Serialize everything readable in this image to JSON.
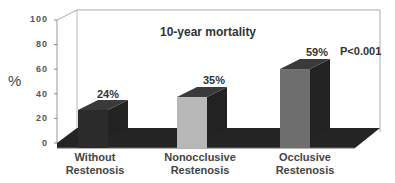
{
  "chart_data": {
    "type": "bar",
    "style": "3d-column",
    "title": "10-year mortality",
    "xlabel": "",
    "ylabel": "%",
    "ylim": [
      0,
      100
    ],
    "yticks": [
      "0",
      "20",
      "40",
      "60",
      "80",
      "100"
    ],
    "categories": [
      "Without Restenosis",
      "Nonocclusive Restenosis",
      "Occlusive Restenosis"
    ],
    "category_lines": [
      [
        "Without",
        "Restenosis"
      ],
      [
        "Nonocclusive",
        "Restenosis"
      ],
      [
        "Occlusive",
        "Restenosis"
      ]
    ],
    "values": [
      24,
      35,
      59
    ],
    "value_labels": [
      "24%",
      "35%",
      "59%"
    ],
    "annotations": [
      "P<0.001"
    ],
    "grid": false,
    "legend": null,
    "colors": {
      "bar_without_front": "#2b2b2b",
      "bar_nonocclusive_front": "#b8b8b8",
      "bar_occlusive_front": "#6e6e6e",
      "bar_side": "#222222",
      "bar_top": "#3a3a3a",
      "floor": "#242424",
      "wall_line": "#aaaaaa"
    }
  }
}
